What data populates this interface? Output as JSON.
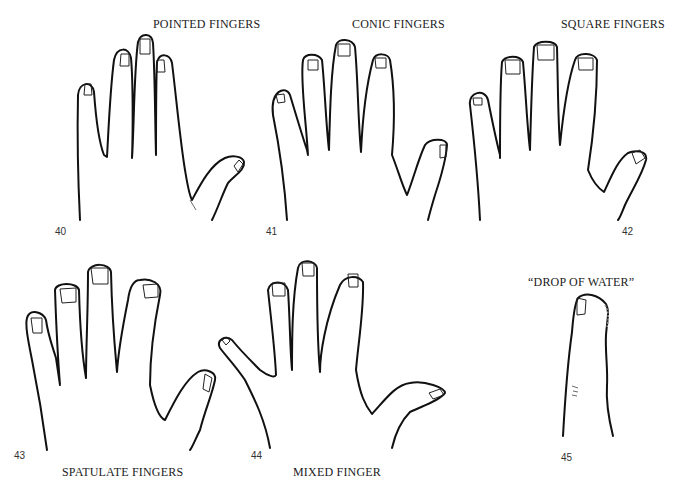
{
  "figures": [
    {
      "number": "40",
      "title": "POINTED FINGERS"
    },
    {
      "number": "41",
      "title": "CONIC FINGERS"
    },
    {
      "number": "42",
      "title": "SQUARE FINGERS"
    },
    {
      "number": "43",
      "title": "SPATULATE FINGERS"
    },
    {
      "number": "44",
      "title": "MIXED FINGER"
    },
    {
      "number": "45",
      "title": "“DROP OF WATER”"
    }
  ]
}
